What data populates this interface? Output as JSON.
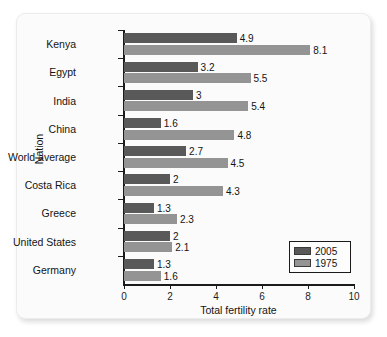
{
  "chart_data": {
    "type": "bar",
    "orientation": "horizontal",
    "title": "",
    "xlabel": "Total fertility rate",
    "ylabel": "Nation",
    "xlim": [
      0,
      10
    ],
    "xticks": [
      0,
      2,
      4,
      6,
      8,
      10
    ],
    "grid": false,
    "legend_position": "bottom-right",
    "categories": [
      "Kenya",
      "Egypt",
      "India",
      "China",
      "World average",
      "Costa Rica",
      "Greece",
      "United States",
      "Germany"
    ],
    "series": [
      {
        "name": "2005",
        "color": "#595959",
        "values": [
          4.9,
          3.2,
          3,
          1.6,
          2.7,
          2,
          1.3,
          2,
          1.3
        ],
        "labels": [
          "4.9",
          "3.2",
          "3",
          "1.6",
          "2.7",
          "2",
          "1.3",
          "2",
          "1.3"
        ]
      },
      {
        "name": "1975",
        "color": "#949494",
        "values": [
          8.1,
          5.5,
          5.4,
          4.8,
          4.5,
          4.3,
          2.3,
          2.1,
          1.6
        ],
        "labels": [
          "8.1",
          "5.5",
          "5.4",
          "4.8",
          "4.5",
          "4.3",
          "2.3",
          "2.1",
          "1.6"
        ]
      }
    ]
  }
}
